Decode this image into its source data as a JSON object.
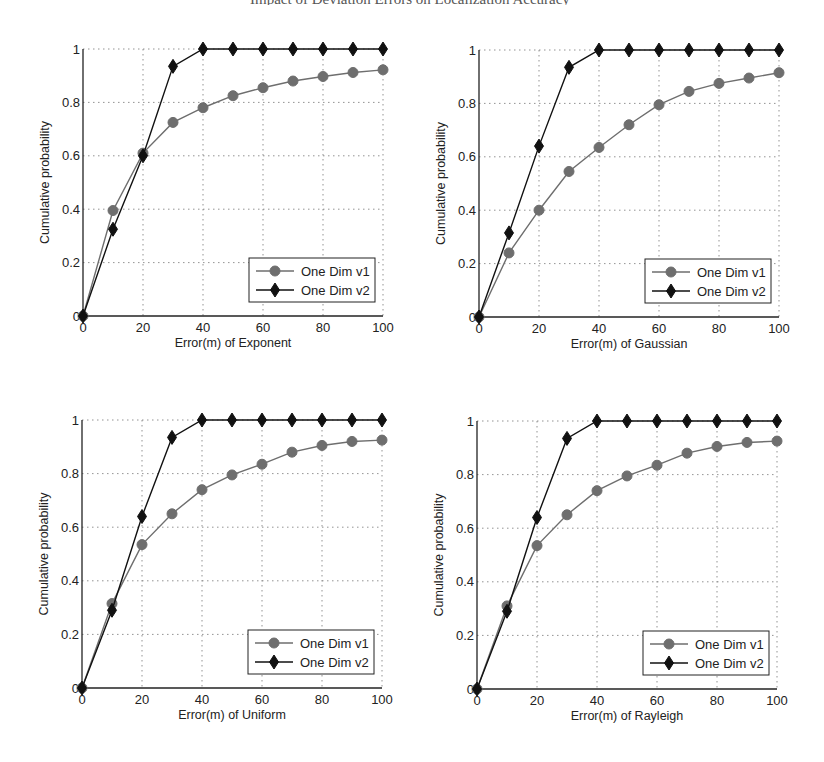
{
  "header": {
    "text": "Impact of Deviation Errors on Localization Accuracy"
  },
  "chart_data": [
    {
      "type": "line",
      "title": "",
      "xlabel": "Error(m) of Exponent",
      "ylabel": "Cumulative probability",
      "xlim": [
        0,
        100
      ],
      "ylim": [
        0,
        1
      ],
      "xticks": [
        0,
        20,
        40,
        60,
        80,
        100
      ],
      "yticks": [
        0,
        0.2,
        0.4,
        0.6,
        0.8,
        1
      ],
      "ytick_labels": [
        "0",
        "0.2",
        "0.4",
        "0.6",
        "0.8",
        "1"
      ],
      "grid": true,
      "legend_position": "lower right",
      "x": [
        0,
        10,
        20,
        30,
        40,
        50,
        60,
        70,
        80,
        90,
        100
      ],
      "series": [
        {
          "name": "One Dim v1",
          "marker": "circle",
          "color": "#6e6e6e",
          "values": [
            0,
            0.395,
            0.61,
            0.725,
            0.78,
            0.825,
            0.855,
            0.88,
            0.897,
            0.912,
            0.922
          ]
        },
        {
          "name": "One Dim v2",
          "marker": "diamond",
          "color": "#111111",
          "values": [
            0,
            0.325,
            0.6,
            0.935,
            1,
            1,
            1,
            1,
            1,
            1,
            1
          ]
        }
      ]
    },
    {
      "type": "line",
      "title": "",
      "xlabel": "Error(m) of Gaussian",
      "ylabel": "Cumulative probability",
      "xlim": [
        0,
        100
      ],
      "ylim": [
        0,
        1
      ],
      "xticks": [
        0,
        20,
        40,
        60,
        80,
        100
      ],
      "yticks": [
        0,
        0.2,
        0.4,
        0.6,
        0.8,
        1
      ],
      "ytick_labels": [
        "0",
        "0.2",
        "0.4",
        "0.6",
        "0.8",
        "1"
      ],
      "grid": true,
      "legend_position": "lower right",
      "x": [
        0,
        10,
        20,
        30,
        40,
        50,
        60,
        70,
        80,
        90,
        100
      ],
      "series": [
        {
          "name": "One Dim v1",
          "marker": "circle",
          "color": "#6e6e6e",
          "values": [
            0,
            0.24,
            0.4,
            0.545,
            0.635,
            0.72,
            0.795,
            0.845,
            0.875,
            0.895,
            0.915
          ]
        },
        {
          "name": "One Dim v2",
          "marker": "diamond",
          "color": "#111111",
          "values": [
            0,
            0.315,
            0.64,
            0.935,
            1,
            1,
            1,
            1,
            1,
            1,
            1
          ]
        }
      ]
    },
    {
      "type": "line",
      "title": "",
      "xlabel": "Error(m) of Uniform",
      "ylabel": "Cumulative probability",
      "xlim": [
        0,
        100
      ],
      "ylim": [
        0,
        1
      ],
      "xticks": [
        0,
        20,
        40,
        60,
        80,
        100
      ],
      "yticks": [
        0,
        0.2,
        0.4,
        0.6,
        0.8,
        1
      ],
      "ytick_labels": [
        "0",
        "0.2",
        "0.4",
        "0.6",
        "0.8",
        "1"
      ],
      "grid": true,
      "legend_position": "lower right",
      "x": [
        0,
        10,
        20,
        30,
        40,
        50,
        60,
        70,
        80,
        90,
        100
      ],
      "series": [
        {
          "name": "One Dim v1",
          "marker": "circle",
          "color": "#6e6e6e",
          "values": [
            0,
            0.315,
            0.535,
            0.65,
            0.74,
            0.795,
            0.835,
            0.88,
            0.905,
            0.92,
            0.925
          ]
        },
        {
          "name": "One Dim v2",
          "marker": "diamond",
          "color": "#111111",
          "values": [
            0,
            0.29,
            0.64,
            0.935,
            1,
            1,
            1,
            1,
            1,
            1,
            1
          ]
        }
      ]
    },
    {
      "type": "line",
      "title": "",
      "xlabel": "Error(m) of Rayleigh",
      "ylabel": "Cumulative probability",
      "xlim": [
        0,
        100
      ],
      "ylim": [
        0,
        1
      ],
      "xticks": [
        0,
        20,
        40,
        60,
        80,
        100
      ],
      "yticks": [
        0,
        0.2,
        0.4,
        0.6,
        0.8,
        1
      ],
      "ytick_labels": [
        "0",
        "0.2",
        "0.4",
        "0.6",
        "0.8",
        "1"
      ],
      "grid": true,
      "legend_position": "lower right",
      "x": [
        0,
        10,
        20,
        30,
        40,
        50,
        60,
        70,
        80,
        90,
        100
      ],
      "series": [
        {
          "name": "One Dim v1",
          "marker": "circle",
          "color": "#6e6e6e",
          "values": [
            0,
            0.31,
            0.535,
            0.65,
            0.74,
            0.795,
            0.835,
            0.88,
            0.905,
            0.92,
            0.925
          ]
        },
        {
          "name": "One Dim v2",
          "marker": "diamond",
          "color": "#111111",
          "values": [
            0,
            0.29,
            0.64,
            0.935,
            1,
            1,
            1,
            1,
            1,
            1,
            1
          ]
        }
      ]
    }
  ]
}
